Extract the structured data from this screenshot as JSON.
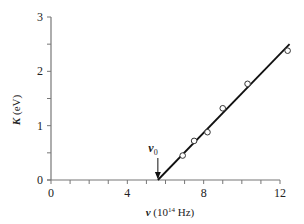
{
  "chart_data": {
    "type": "scatter",
    "title": "",
    "xlabel": "ν (10¹⁴ Hz)",
    "xlabel_parts": {
      "symbol": "ν",
      "base": " (10",
      "exp": "14",
      "unit": " Hz)"
    },
    "ylabel": "K (eV)",
    "ylabel_parts": {
      "symbol": "K",
      "unit": " (eV)"
    },
    "xlim": [
      0,
      12.5
    ],
    "ylim": [
      0,
      3
    ],
    "x_ticks_major": [
      0,
      4,
      8,
      12
    ],
    "x_tick_labels": [
      "0",
      "4",
      "8",
      "12"
    ],
    "x_ticks_minor": [
      1,
      2,
      3,
      5,
      6,
      7,
      9,
      10,
      11
    ],
    "y_ticks_major": [
      0,
      1,
      2,
      3
    ],
    "y_tick_labels": [
      "0",
      "1",
      "2",
      "3"
    ],
    "y_ticks_minor": [
      0.5,
      1.5,
      2.5
    ],
    "grid": false,
    "legend": null,
    "series": [
      {
        "name": "measured points",
        "marker": "open-circle",
        "points": [
          {
            "x": 6.9,
            "y": 0.45
          },
          {
            "x": 7.5,
            "y": 0.72
          },
          {
            "x": 8.2,
            "y": 0.88
          },
          {
            "x": 9.0,
            "y": 1.32
          },
          {
            "x": 10.3,
            "y": 1.77
          },
          {
            "x": 12.4,
            "y": 2.38
          }
        ]
      },
      {
        "name": "fit line",
        "style": "solid",
        "points": [
          {
            "x": 5.6,
            "y": 0.0
          },
          {
            "x": 12.5,
            "y": 2.5
          }
        ]
      }
    ],
    "annotations": [
      {
        "text": "ν",
        "subscript": "0",
        "x": 5.6,
        "y": 0.0,
        "type": "arrow-down",
        "meaning": "threshold frequency"
      }
    ]
  }
}
